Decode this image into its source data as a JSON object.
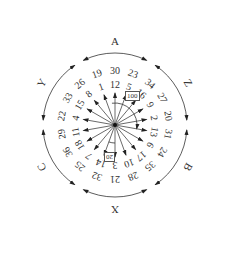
{
  "diagram": {
    "center": [
      115,
      125
    ],
    "ray_count": 18,
    "ray_spacing_deg": 20,
    "rays": [
      {
        "angle": 0,
        "inner": "12",
        "outer": "30"
      },
      {
        "angle": 20,
        "inner": "5",
        "outer": "23"
      },
      {
        "angle": 40,
        "inner": "16",
        "outer": "34"
      },
      {
        "angle": 60,
        "inner": "9",
        "outer": "27"
      },
      {
        "angle": 80,
        "inner": "2",
        "outer": "20"
      },
      {
        "angle": 100,
        "inner": "13",
        "outer": "31"
      },
      {
        "angle": 120,
        "inner": "6",
        "outer": "24"
      },
      {
        "angle": 140,
        "inner": "17",
        "outer": "35"
      },
      {
        "angle": 160,
        "inner": "10",
        "outer": "28"
      },
      {
        "angle": 180,
        "inner": "3",
        "outer": "21"
      },
      {
        "angle": 200,
        "inner": "14",
        "outer": "32"
      },
      {
        "angle": 220,
        "inner": "7",
        "outer": "25"
      },
      {
        "angle": 240,
        "inner": "18",
        "outer": "36"
      },
      {
        "angle": 260,
        "inner": "11",
        "outer": "29"
      },
      {
        "angle": 280,
        "inner": "4",
        "outer": "22"
      },
      {
        "angle": 300,
        "inner": "15",
        "outer": "33"
      },
      {
        "angle": 320,
        "inner": "8",
        "outer": "26"
      },
      {
        "angle": 340,
        "inner": "1",
        "outer": "19"
      }
    ],
    "groups": [
      {
        "name": "A",
        "angle": 0
      },
      {
        "name": "Z",
        "angle": 60
      },
      {
        "name": "B",
        "angle": 120
      },
      {
        "name": "X",
        "angle": 180
      },
      {
        "name": "C",
        "angle": 240
      },
      {
        "name": "Y",
        "angle": 300
      }
    ],
    "angle_annotations": [
      {
        "label": "100",
        "angle_from": 0,
        "angle_to": 100
      },
      {
        "label": "20",
        "angle_from": 180,
        "angle_to": 200
      }
    ]
  }
}
